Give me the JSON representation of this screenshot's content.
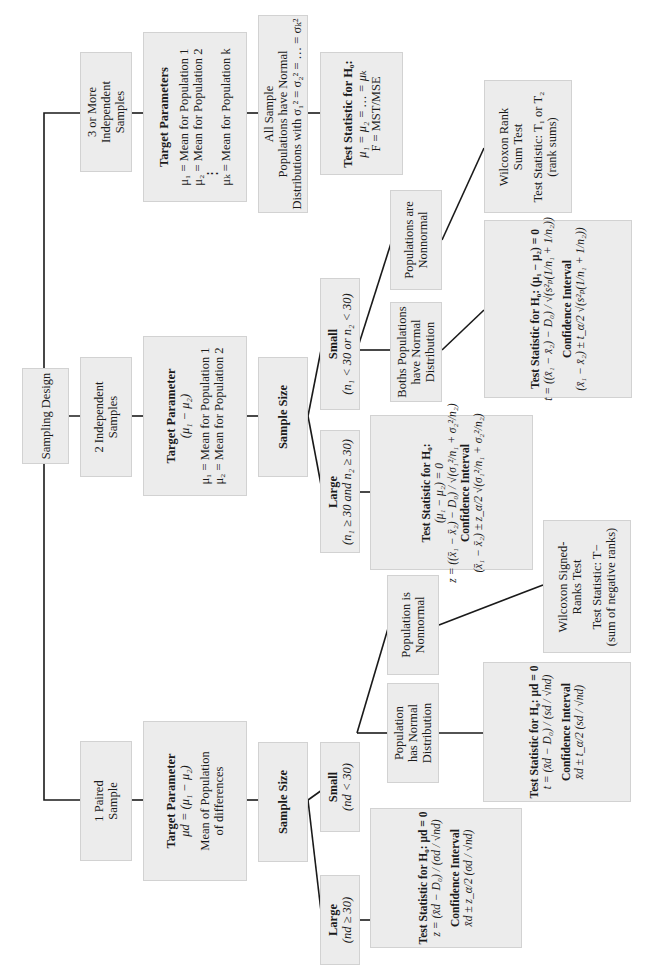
{
  "root": {
    "label": "Sampling Design"
  },
  "branches": [
    {
      "id": "three_or_more",
      "design": [
        "3 or More",
        "Independent",
        "Samples"
      ],
      "target": {
        "title": "Target Parameters",
        "lines": [
          "μ₁ = Mean for Population 1",
          "μ₂ = Mean for Population 2",
          "⋮",
          "μₖ = Mean for Population k"
        ]
      },
      "condition": [
        "All Sample",
        "Populations have Normal",
        "Distributions with σ₁² = σ₂² = … = σₖ²"
      ],
      "test": {
        "title": "Test Statistic for H₀:",
        "lines": [
          "μ₁ = μ₂ = … = μₖ",
          "F = MST/MSE"
        ]
      }
    },
    {
      "id": "two_independent",
      "design": [
        "2 Independent",
        "Samples"
      ],
      "target": {
        "title": "Target Parameter",
        "subtitle": "(μ₁ − μ₂)",
        "lines": [
          "μ₁ = Mean for Population 1",
          "μ₂ = Mean for Population 2"
        ]
      },
      "sample_size": "Sample Size",
      "large": {
        "title": "Large",
        "condition": "(n₁ ≥ 30 and n₂ ≥ 30)",
        "test": {
          "title": "Test Statistic for H₀:",
          "hypothesis": "(μ₁ − μ₂) = 0",
          "formula": "z = ((x̄₁ − x̄₂) − D₀) / √(σ₁²/n₁ + σ₂²/n₂)",
          "ci_title": "Confidence Interval",
          "ci_formula": "(x̄₁ − x̄₂) ± z_α/2 √(σ₁²/n₁ + σ₂²/n₂)"
        }
      },
      "small": {
        "title": "Small",
        "condition": "(n₁ < 30 or n₂ < 30)",
        "normal": {
          "label": [
            "Boths Populations",
            "have Normal",
            "Distribution"
          ],
          "test": {
            "title": "Test Statistic for H₀: (μ₁ − μ₂) = 0",
            "formula": "t = ((x̄₁ − x̄₂) − D₀) / √(s²ₚ(1/n₁ + 1/n₂))",
            "ci_title": "Confidence Interval",
            "ci_formula": "(x̄₁ − x̄₂) ± t_α/2 √(s²ₚ(1/n₁ + 1/n₂))"
          }
        },
        "nonnormal": {
          "label": [
            "Populations are",
            "Nonnormal"
          ],
          "test": {
            "lines": [
              "Wilcoxon Rank",
              "Sum Test"
            ],
            "stat": [
              "Test Statistic: T₁ or T₂",
              "(rank sums)"
            ]
          }
        }
      }
    },
    {
      "id": "paired",
      "design": [
        "1 Paired",
        "Sample"
      ],
      "target": {
        "title": "Target Parameter",
        "subtitle": "μd = (μ₁ − μ₂)",
        "lines": [
          "Mean of Population",
          "of differences"
        ]
      },
      "sample_size": "Sample Size",
      "large": {
        "title": "Large",
        "condition": "(nd ≥ 30)",
        "test": {
          "title": "Test Statistic for H₀: μd = 0",
          "formula": "z = (x̄d − D₀) / (σd / √nd)",
          "ci_title": "Confidence Interval",
          "ci_formula": "x̄d ± z_α/2 (σd / √nd)"
        }
      },
      "small": {
        "title": "Small",
        "condition": "(nd < 30)",
        "normal": {
          "label": [
            "Population",
            "has Normal",
            "Distribution"
          ],
          "test": {
            "title": "Test Statistic for H₀: μd = 0",
            "formula": "t = (x̄d − D₀) / (sd / √nd)",
            "ci_title": "Confidence Interval",
            "ci_formula": "x̄d ± t_α/2 (sd / √nd)"
          }
        },
        "nonnormal": {
          "label": [
            "Population is",
            "Nonnormal"
          ],
          "test": {
            "lines": [
              "Wilcoxon Signed-",
              "Ranks Test"
            ],
            "stat": [
              "Test Statistic: T−",
              "(sum of negative ranks)"
            ]
          }
        }
      }
    }
  ],
  "colors": {
    "box_fill": "#ececec",
    "box_border": "#d2d2d2",
    "line": "#1a1a1a",
    "background": "#ffffff"
  }
}
